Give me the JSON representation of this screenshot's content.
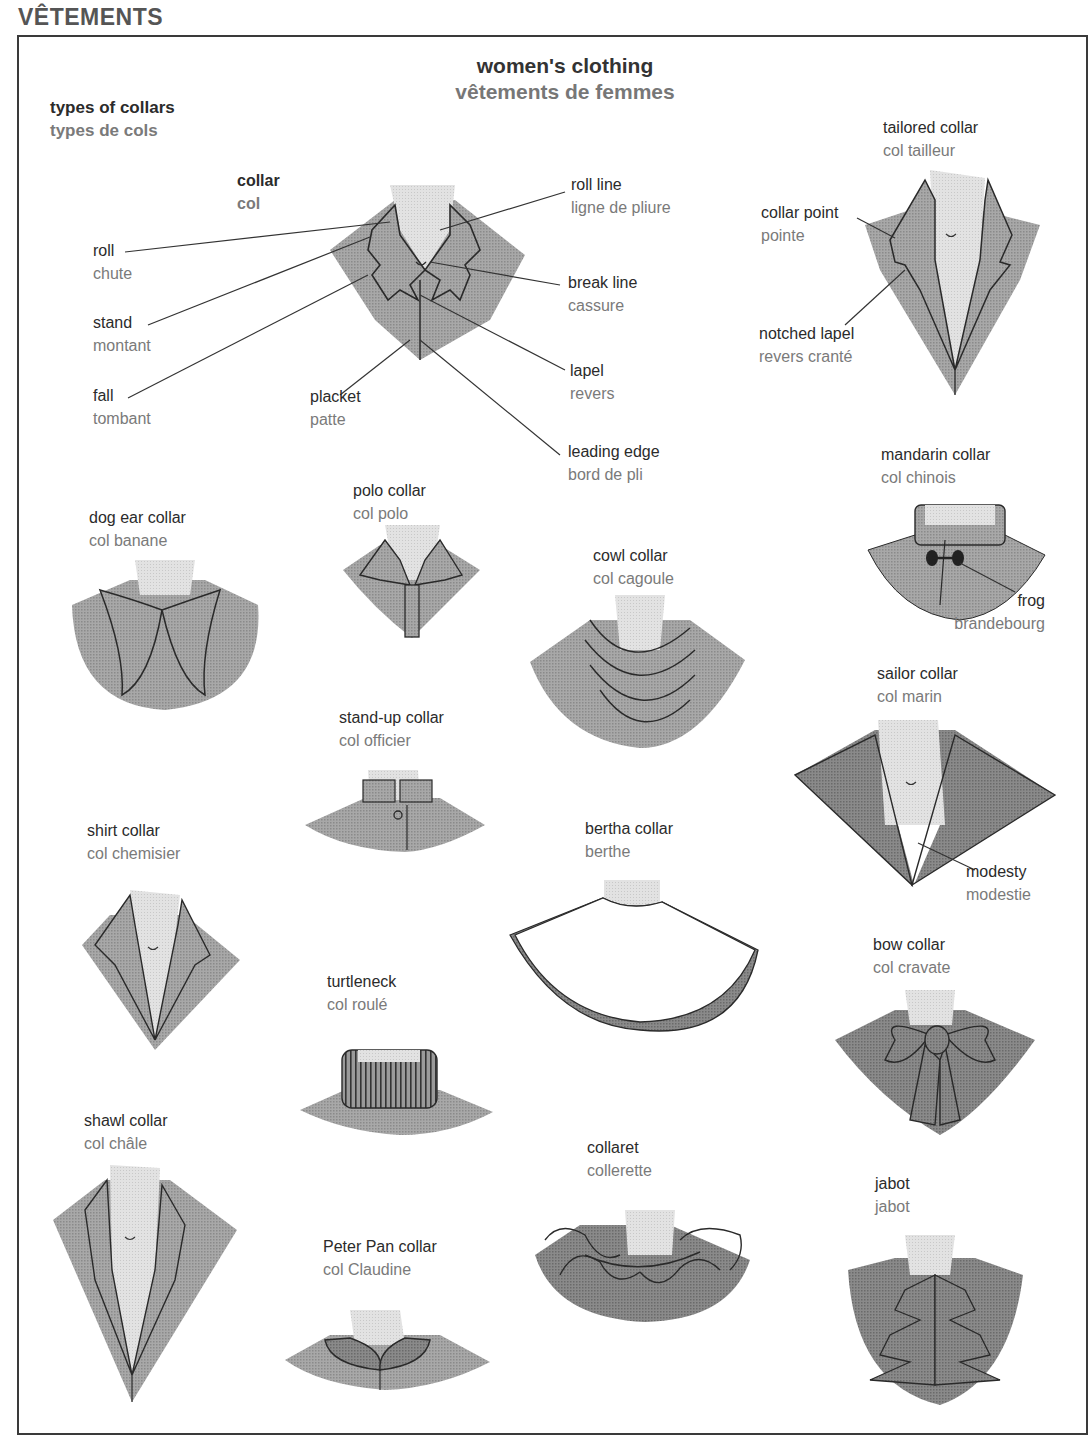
{
  "page": {
    "section_title": "VÊTEMENTS",
    "title_en": "women's clothing",
    "title_fr": "vêtements de femmes",
    "subtitle_en": "types of collars",
    "subtitle_fr": "types de cols"
  },
  "colors": {
    "fabric": "#9a9a9a",
    "fabric_dark": "#7c7c7c",
    "skin": "#dcdcdc",
    "outline": "#2a2a2a",
    "text_en": "#2b2b2b",
    "text_fr": "#7a7a7a"
  },
  "collar_parts": {
    "main": {
      "en": "collar",
      "fr": "col"
    },
    "roll": {
      "en": "roll",
      "fr": "chute"
    },
    "stand": {
      "en": "stand",
      "fr": "montant"
    },
    "fall": {
      "en": "fall",
      "fr": "tombant"
    },
    "placket": {
      "en": "placket",
      "fr": "patte"
    },
    "roll_line": {
      "en": "roll line",
      "fr": "ligne de pliure"
    },
    "break_line": {
      "en": "break line",
      "fr": "cassure"
    },
    "lapel": {
      "en": "lapel",
      "fr": "revers"
    },
    "leading_edge": {
      "en": "leading edge",
      "fr": "bord de pli"
    }
  },
  "collars": {
    "tailored": {
      "en": "tailored collar",
      "fr": "col tailleur"
    },
    "collar_point": {
      "en": "collar point",
      "fr": "pointe"
    },
    "notched_lapel": {
      "en": "notched lapel",
      "fr": "revers cranté"
    },
    "mandarin": {
      "en": "mandarin collar",
      "fr": "col chinois"
    },
    "frog": {
      "en": "frog",
      "fr": "brandebourg"
    },
    "dog_ear": {
      "en": "dog ear collar",
      "fr": "col banane"
    },
    "polo": {
      "en": "polo collar",
      "fr": "col polo"
    },
    "cowl": {
      "en": "cowl collar",
      "fr": "col cagoule"
    },
    "sailor": {
      "en": "sailor collar",
      "fr": "col marin"
    },
    "modesty": {
      "en": "modesty",
      "fr": "modestie"
    },
    "stand_up": {
      "en": "stand-up collar",
      "fr": "col officier"
    },
    "shirt": {
      "en": "shirt collar",
      "fr": "col chemisier"
    },
    "bertha": {
      "en": "bertha collar",
      "fr": "berthe"
    },
    "bow": {
      "en": "bow collar",
      "fr": "col cravate"
    },
    "turtleneck": {
      "en": "turtleneck",
      "fr": "col roulé"
    },
    "shawl": {
      "en": "shawl collar",
      "fr": "col châle"
    },
    "collaret": {
      "en": "collaret",
      "fr": "collerette"
    },
    "jabot": {
      "en": "jabot",
      "fr": "jabot"
    },
    "peter_pan": {
      "en": "Peter Pan collar",
      "fr": "col Claudine"
    }
  }
}
